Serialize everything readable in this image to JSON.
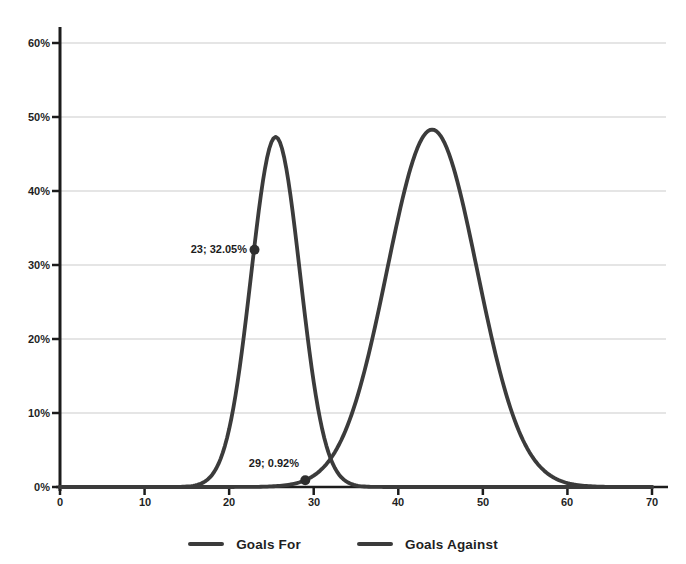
{
  "chart_data": {
    "type": "line",
    "title": "",
    "xlabel": "",
    "ylabel": "",
    "x_ticks": [
      "0",
      "10",
      "20",
      "30",
      "40",
      "50",
      "60",
      "70"
    ],
    "y_ticks": [
      "0%",
      "10%",
      "20%",
      "30%",
      "40%",
      "50%",
      "60%"
    ],
    "xlim": [
      0,
      70
    ],
    "ylim_pct": [
      0,
      60
    ],
    "grid": "horizontal-on",
    "legend_position": "bottom-center",
    "colors": {
      "curve": "#3b3b3b",
      "axis": "#1c1c1c",
      "gridline": "#cbcbcb",
      "marker": "#2e2e2e",
      "label_text": "#1f1f1f"
    },
    "series": [
      {
        "name": "Goals For",
        "shape": "bell-curve",
        "model": {
          "type": "gaussian",
          "mean": 25.5,
          "sd": 2.9,
          "peak_pct": 47.3
        },
        "x": [
          12,
          13,
          14,
          15,
          16,
          17,
          18,
          19,
          20,
          21,
          22,
          23,
          24,
          25,
          26,
          27,
          28,
          29,
          30,
          31,
          32,
          33,
          34,
          35,
          36,
          37,
          38,
          39
        ],
        "y_pct": [
          0.0,
          0.0,
          0.02,
          0.07,
          0.22,
          0.64,
          1.67,
          3.84,
          7.84,
          14.19,
          22.83,
          32.62,
          41.38,
          46.6,
          46.6,
          41.38,
          32.62,
          22.83,
          14.19,
          7.84,
          3.84,
          1.67,
          0.64,
          0.22,
          0.07,
          0.02,
          0.01,
          0.0
        ]
      },
      {
        "name": "Goals Against",
        "shape": "bell-curve",
        "model": {
          "type": "gaussian",
          "mean": 44,
          "sd": 5.33,
          "peak_pct": 48.3
        },
        "x": [
          27,
          28,
          29,
          30,
          31,
          32,
          33,
          34,
          35,
          36,
          37,
          38,
          39,
          40,
          41,
          42,
          43,
          44,
          45,
          46,
          47,
          48,
          49,
          50,
          51,
          52,
          53,
          54,
          55,
          56,
          57,
          58,
          59,
          60,
          61,
          62,
          63,
          64,
          65
        ],
        "y_pct": [
          0.3,
          0.53,
          0.92,
          1.53,
          2.47,
          3.83,
          5.74,
          8.31,
          11.61,
          15.66,
          20.39,
          25.63,
          31.11,
          36.45,
          41.22,
          45.02,
          47.46,
          48.3,
          47.46,
          45.02,
          41.22,
          36.45,
          31.11,
          25.63,
          20.39,
          15.66,
          11.61,
          8.31,
          5.74,
          3.83,
          2.47,
          1.53,
          0.92,
          0.53,
          0.3,
          0.16,
          0.08,
          0.04,
          0.02
        ]
      }
    ],
    "annotations": [
      {
        "label": "23; 32.05%",
        "x": 23,
        "y_pct": 32.05,
        "series": "Goals For"
      },
      {
        "label": "29; 0.92%",
        "x": 29,
        "y_pct": 0.92,
        "series": "Goals Against"
      }
    ]
  },
  "legend": {
    "items": [
      {
        "label": "Goals For"
      },
      {
        "label": "Goals Against"
      }
    ]
  }
}
